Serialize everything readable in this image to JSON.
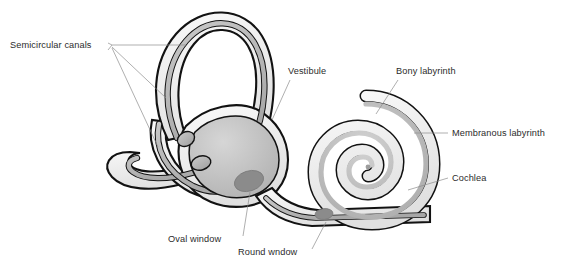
{
  "figure": {
    "background_color": "#ffffff",
    "width": 561,
    "height": 265
  },
  "palette": {
    "outline": "#121212",
    "bony_light": "#f2f2f2",
    "bony_mid": "#e2e2e2",
    "membranous": "#b4b4b4",
    "duct": "#9d9d9d",
    "window_fill": "#8b8b8b",
    "label_text": "#2b2b2b",
    "leader_line": "#8c8c8c"
  },
  "labels": [
    {
      "id": "semicircular-canals",
      "text": "Semicircular canals",
      "x": 10,
      "y": 48,
      "anchor": "start"
    },
    {
      "id": "vestibule",
      "text": "Vestibule",
      "x": 288,
      "y": 74,
      "anchor": "start"
    },
    {
      "id": "bony-labyrinth",
      "text": "Bony labyrinth",
      "x": 396,
      "y": 74,
      "anchor": "start"
    },
    {
      "id": "membranous-labyrinth",
      "text": "Membranous labyrinth",
      "x": 452,
      "y": 136,
      "anchor": "start"
    },
    {
      "id": "cochlea",
      "text": "Cochlea",
      "x": 452,
      "y": 181,
      "anchor": "start"
    },
    {
      "id": "oval-window",
      "text": "Oval window",
      "x": 168,
      "y": 242,
      "anchor": "start"
    },
    {
      "id": "round-window",
      "text": "Round wndow",
      "x": 238,
      "y": 255,
      "anchor": "start"
    }
  ],
  "structures": [
    {
      "id": "superior-semicircular-canal",
      "name": "Superior semicircular canal"
    },
    {
      "id": "posterior-semicircular-canal",
      "name": "Posterior semicircular canal"
    },
    {
      "id": "lateral-semicircular-canal",
      "name": "Lateral semicircular canal"
    },
    {
      "id": "vestibule-bulb",
      "name": "Vestibule"
    },
    {
      "id": "cochlear-spiral",
      "name": "Cochlea"
    },
    {
      "id": "oval-window-opening",
      "name": "Oval window"
    },
    {
      "id": "round-window-opening",
      "name": "Round window"
    }
  ]
}
